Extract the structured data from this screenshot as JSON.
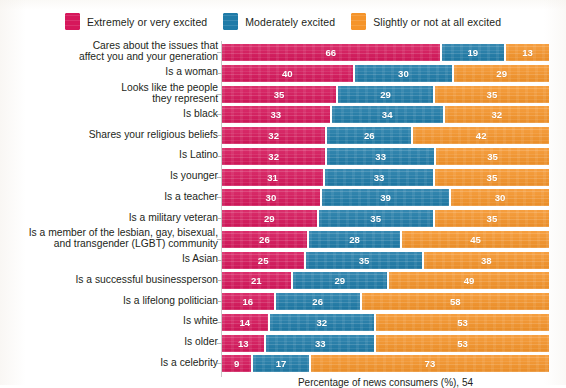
{
  "legend": {
    "items": [
      {
        "label": "Extremely or very excited",
        "color": "#D6175B",
        "icon": "legend-swatch-icon"
      },
      {
        "label": "Moderately excited",
        "color": "#1F7BA8",
        "icon": "legend-swatch-icon"
      },
      {
        "label": "Slightly or not at all excited",
        "color": "#F5942A",
        "icon": "legend-swatch-icon"
      }
    ]
  },
  "xlabel": "Percentage of news consumers (%), 54",
  "chart_data": {
    "type": "bar",
    "orientation": "horizontal",
    "stacked": true,
    "normalized_to_100": true,
    "title": "",
    "subtitle": "",
    "xlabel": "Percentage of news consumers (%), 54",
    "ylabel": "",
    "xlim": [
      0,
      100
    ],
    "grid": false,
    "legend_position": "top-center",
    "colors": {
      "Extremely or very excited": "#D6175B",
      "Moderately excited": "#1F7BA8",
      "Slightly or not at all excited": "#F5942A"
    },
    "categories": [
      "Cares about the issues that\naffect you and your generation",
      "Is a woman",
      "Looks like the people\nthey represent",
      "Is black",
      "Shares your religious beliefs",
      "Is Latino",
      "Is younger",
      "Is a teacher",
      "Is a military veteran",
      "Is a member of the lesbian, gay, bisexual,\nand transgender (LGBT) community",
      "Is Asian",
      "Is a successful businessperson",
      "Is a lifelong politician",
      "Is white",
      "Is older",
      "Is a celebrity"
    ],
    "series": [
      {
        "name": "Extremely or very excited",
        "values": [
          66,
          40,
          35,
          33,
          32,
          32,
          31,
          30,
          29,
          26,
          25,
          21,
          16,
          14,
          13,
          9
        ]
      },
      {
        "name": "Moderately excited",
        "values": [
          19,
          30,
          29,
          34,
          26,
          33,
          33,
          39,
          35,
          28,
          35,
          29,
          26,
          32,
          33,
          17
        ]
      },
      {
        "name": "Slightly or not at all excited",
        "values": [
          13,
          29,
          35,
          32,
          42,
          35,
          35,
          30,
          35,
          45,
          38,
          49,
          58,
          53,
          53,
          73
        ]
      }
    ]
  }
}
